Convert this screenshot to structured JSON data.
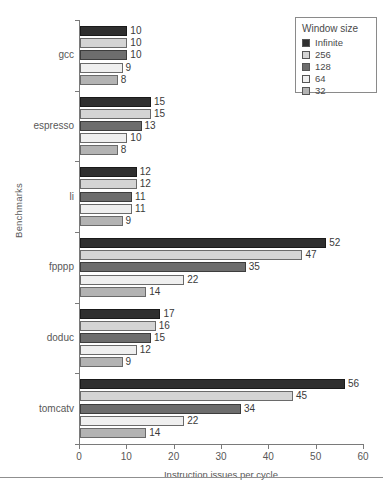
{
  "chart_data": {
    "type": "bar",
    "orientation": "horizontal",
    "title": "",
    "xlabel": "Instruction issues per cycle",
    "ylabel": "Benchmarks",
    "xlim": [
      0,
      60
    ],
    "xticks": [
      0,
      10,
      20,
      30,
      40,
      50,
      60
    ],
    "grid": false,
    "legend_position": "top-right",
    "legend_title": "Window size",
    "categories": [
      "gcc",
      "espresso",
      "li",
      "fpppp",
      "doduc",
      "tomcatv"
    ],
    "series": [
      {
        "name": "Infinite",
        "color": "#2f2f2f",
        "values": [
          10,
          15,
          12,
          52,
          17,
          56
        ]
      },
      {
        "name": "256",
        "color": "#d4d4d4",
        "values": [
          10,
          15,
          12,
          47,
          16,
          45
        ]
      },
      {
        "name": "128",
        "color": "#6d6d6d",
        "values": [
          10,
          13,
          11,
          35,
          15,
          34
        ]
      },
      {
        "name": "64",
        "color": "#efefef",
        "values": [
          9,
          10,
          11,
          22,
          12,
          22
        ]
      },
      {
        "name": "32",
        "color": "#b3b3b3",
        "values": [
          8,
          8,
          9,
          14,
          9,
          14
        ]
      }
    ]
  }
}
